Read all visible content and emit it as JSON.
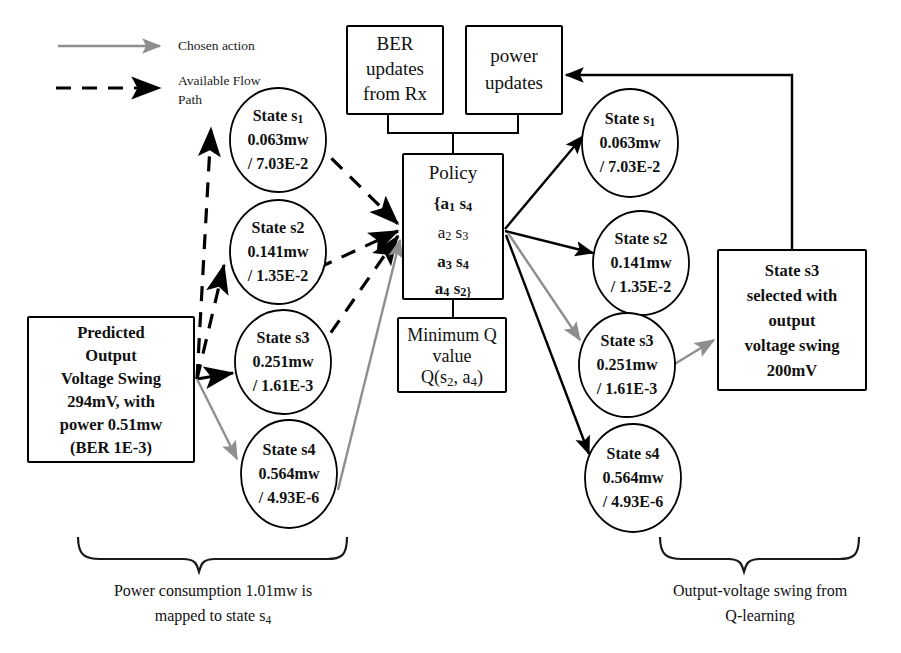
{
  "diagram": {
    "colors": {
      "chosen_action": "#8e8e8e",
      "available_flow_path": "#000000",
      "inactive_policy_entry": "#9a9a9a",
      "background": "#ffffff",
      "stroke": "#000000"
    },
    "legend": {
      "items": [
        {
          "label": "Chosen action",
          "style": "solid-gray-arrow",
          "color": "#8e8e8e"
        },
        {
          "label": "Available Flow",
          "label2": "Path",
          "style": "dashed-black-arrow",
          "color": "#000000"
        }
      ]
    },
    "boxes": {
      "predicted_input": {
        "lines": [
          "Predicted",
          "Output",
          "Voltage Swing",
          "294mV, with",
          "power 0.51mw",
          "(BER 1E-3)"
        ]
      },
      "ber_updates": {
        "lines": [
          "BER",
          "updates",
          "from Rx"
        ]
      },
      "power_updates": {
        "lines": [
          "power",
          "updates"
        ]
      },
      "policy": {
        "title": "Policy",
        "entries": [
          {
            "text": "{a",
            "action_sub": "1",
            "state": "s",
            "state_sub": "4",
            "active": true
          },
          {
            "text": "a",
            "action_sub": "2",
            "state": "s",
            "state_sub": "3",
            "active": false
          },
          {
            "text": "a",
            "action_sub": "3",
            "state": "s",
            "state_sub": "4",
            "active": true
          },
          {
            "text": "a",
            "action_sub": "4",
            "state": "s",
            "state_sub": "2}",
            "active": true
          }
        ]
      },
      "minimum_q": {
        "lines": [
          "Minimum Q",
          "value"
        ],
        "q_expr_prefix": "Q(s",
        "q_expr_sub1": "2",
        "q_expr_mid": ", a",
        "q_expr_sub2": "4",
        "q_expr_suffix": ")"
      },
      "result": {
        "lines": [
          "State s3",
          "selected with",
          "output",
          "voltage swing",
          "200mV"
        ]
      }
    },
    "left_states": [
      {
        "name": "State s",
        "sub": "1",
        "power": "0.063mw",
        "ber": "/ 7.03E-2"
      },
      {
        "name": "State s2",
        "sub": "",
        "power": "0.141mw",
        "ber": "/ 1.35E-2"
      },
      {
        "name": "State s3",
        "sub": "",
        "power": "0.251mw",
        "ber": "/ 1.61E-3"
      },
      {
        "name": "State s4",
        "sub": "",
        "power": "0.564mw",
        "ber": "/ 4.93E-6"
      }
    ],
    "right_states": [
      {
        "name": "State s",
        "sub": "1",
        "power": "0.063mw",
        "ber": "/ 7.03E-2"
      },
      {
        "name": "State s2",
        "sub": "",
        "power": "0.141mw",
        "ber": "/ 1.35E-2"
      },
      {
        "name": "State s3",
        "sub": "",
        "power": "0.251mw",
        "ber": "/ 1.61E-3"
      },
      {
        "name": "State s4",
        "sub": "",
        "power": "0.564mw",
        "ber": "/ 4.93E-6"
      }
    ],
    "captions": {
      "left": {
        "line1": "Power consumption 1.01mw is",
        "line2_prefix": "mapped to state s",
        "line2_sub": "4"
      },
      "right": {
        "line1": "Output-voltage swing  from",
        "line2": "Q-learning"
      }
    }
  }
}
